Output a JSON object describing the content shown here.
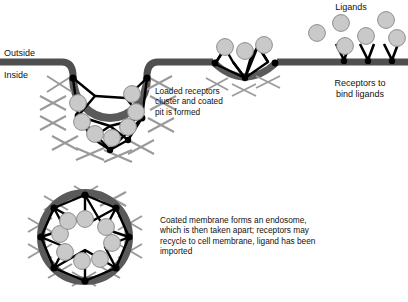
{
  "figure": {
    "title_hidden": "Receptor-mediated endocytosis",
    "background_color": "#ffffff",
    "membrane_color": "#4f4f4f",
    "lattice_color": "#000000",
    "spoke_color": "#9a9a9a",
    "ligand_fill": "#c9c9c9",
    "ligand_stroke": "#8e8e8e",
    "text_color": "#111111"
  },
  "labels": {
    "outside": "Outside",
    "inside": "Inside",
    "ligands": "Ligands",
    "receptors_to_bind": "Receptors to\nbind ligands"
  },
  "captions": {
    "coated_pit": "Loaded receptors\ncluster and coated\npit is formed",
    "endosome": "Coated membrane forms an endosome,\nwhich is then taken apart; receptors may\nrecycle to cell membrane, ligand has been\nimported"
  },
  "counts": {
    "free_ligands": 6,
    "free_receptors": 3,
    "clustered_receptors": 3,
    "coated_pit_ligands": 7,
    "endosome_ligands": 8
  },
  "stages": [
    {
      "name": "free-receptors",
      "label": "Receptors to bind ligands"
    },
    {
      "name": "receptor-clustering",
      "label": "Loaded receptors cluster"
    },
    {
      "name": "coated-pit",
      "label": "Coated pit is formed"
    },
    {
      "name": "endosome",
      "label": "Endosome formed"
    }
  ]
}
